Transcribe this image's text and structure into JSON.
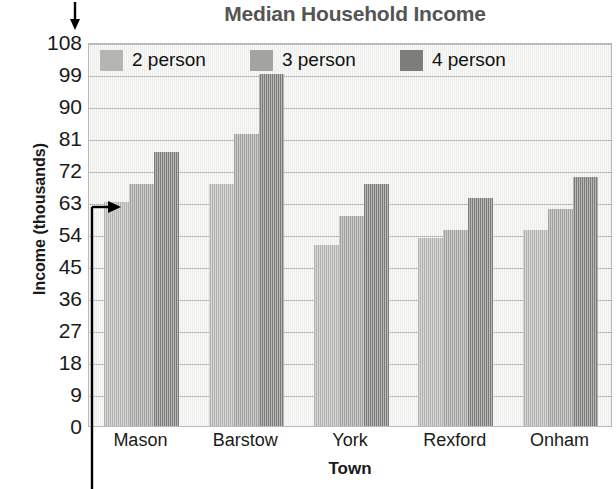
{
  "chart_data": {
    "type": "bar",
    "title": "Median Household Income",
    "xlabel": "Town",
    "ylabel": "Income (thousands)",
    "categories": [
      "Mason",
      "Barstow",
      "York",
      "Rexford",
      "Onham"
    ],
    "series": [
      {
        "name": "2 person",
        "color": "#b5b5b3",
        "values": [
          63,
          68,
          51,
          53,
          55
        ]
      },
      {
        "name": "3 person",
        "color": "#a3a3a1",
        "values": [
          68,
          82,
          59,
          55,
          61
        ]
      },
      {
        "name": "4 person",
        "color": "#7d7d7b",
        "values": [
          77,
          99,
          68,
          64,
          70
        ]
      }
    ],
    "yticks": [
      0,
      9,
      18,
      27,
      36,
      45,
      54,
      63,
      72,
      81,
      90,
      99,
      108
    ],
    "ylim": [
      0,
      108
    ],
    "grid": true,
    "legend_position": "top-inside",
    "plot_background": "#f2f2f0",
    "annotations": [
      {
        "name": "y-axis-down-arrow",
        "kind": "arrow-down",
        "label": ""
      },
      {
        "name": "bar-value-pointer",
        "kind": "elbow-arrow",
        "label": "",
        "points_to": {
          "category": "Mason",
          "series": "2 person",
          "value": 63
        }
      }
    ]
  },
  "legend": {
    "items": [
      {
        "label": "2 person"
      },
      {
        "label": "3 person"
      },
      {
        "label": "4 person"
      }
    ]
  },
  "icons": {
    "down_arrow": "arrow-down-icon",
    "pointer_arrow": "arrow-right-icon"
  }
}
